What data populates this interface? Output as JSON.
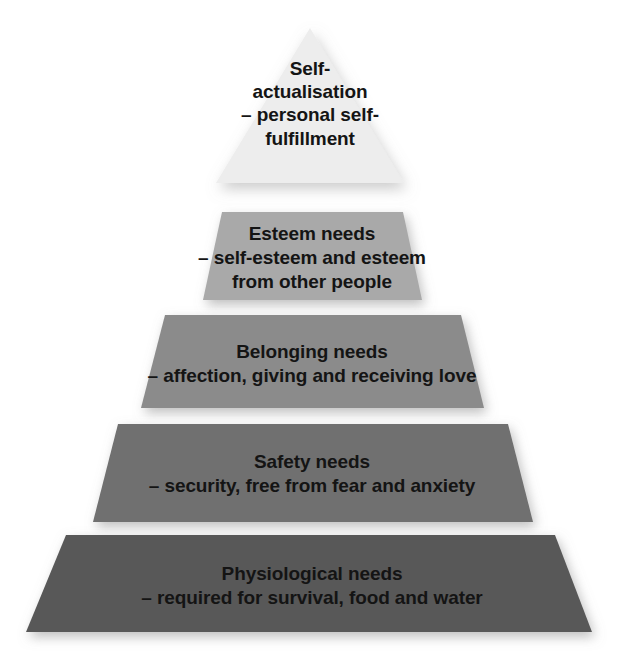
{
  "diagram": {
    "type": "pyramid",
    "name": "maslow-hierarchy-of-needs",
    "background_color": "#ffffff",
    "text_color": "#141414",
    "tier_count": 5,
    "tiers": [
      {
        "index": 1,
        "position": "apex",
        "title": "Self-actualisation",
        "description": "– personal self-fulfillment",
        "text": "Self-\nactualisation\n– personal self-\nfulfillment",
        "fill_color": "#ededed"
      },
      {
        "index": 2,
        "position": "second",
        "title": "Esteem needs",
        "description": "– self-esteem and esteem from other people",
        "text": "Esteem needs\n– self-esteem and esteem\nfrom other people",
        "fill_color": "#a9a9a9"
      },
      {
        "index": 3,
        "position": "middle",
        "title": "Belonging needs",
        "description": "– affection, giving and receiving love",
        "text": "Belonging needs\n– affection, giving and receiving love",
        "fill_color": "#8b8b8b"
      },
      {
        "index": 4,
        "position": "fourth",
        "title": "Safety needs",
        "description": "– security, free from fear and anxiety",
        "text": "Safety needs\n– security, free from fear and anxiety",
        "fill_color": "#6f6f6f"
      },
      {
        "index": 5,
        "position": "base",
        "title": "Physiological needs",
        "description": "– required for survival, food and water",
        "text": "Physiological needs\n– required for survival, food and water",
        "fill_color": "#595959"
      }
    ]
  }
}
